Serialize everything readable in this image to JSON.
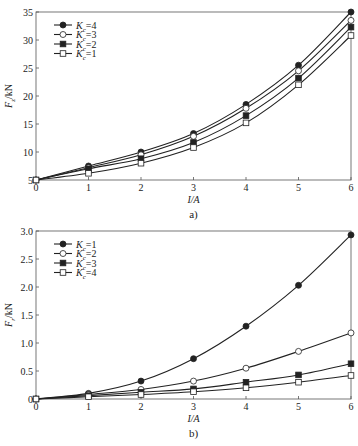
{
  "chart_data": [
    {
      "type": "line",
      "caption": "a)",
      "title": "",
      "xlabel": "I/A",
      "ylabel": "Fz/kN",
      "x": [
        0,
        1,
        2,
        3,
        4,
        5,
        6
      ],
      "xlim": [
        0,
        6
      ],
      "ylim": [
        5,
        35
      ],
      "xticks": [
        0,
        1,
        2,
        3,
        4,
        5,
        6
      ],
      "yticks": [
        5,
        10,
        15,
        20,
        25,
        30,
        35
      ],
      "grid": false,
      "legend_position": "upper left",
      "series": [
        {
          "name": "Kc=4",
          "marker": "filled-circle",
          "values": [
            5,
            7.5,
            10,
            13.3,
            18.5,
            25.5,
            35
          ]
        },
        {
          "name": "Kc=3",
          "marker": "open-circle",
          "values": [
            5,
            7.2,
            9.5,
            12.8,
            17.8,
            24.5,
            33.5
          ]
        },
        {
          "name": "Kc=2",
          "marker": "filled-square",
          "values": [
            5,
            7.0,
            8.8,
            11.7,
            16.5,
            23.2,
            32.3
          ]
        },
        {
          "name": "Kc=1",
          "marker": "open-square",
          "values": [
            5,
            6.2,
            8.0,
            10.8,
            15.2,
            22.0,
            30.8
          ]
        }
      ]
    },
    {
      "type": "line",
      "caption": "b)",
      "title": "",
      "xlabel": "I/A",
      "ylabel": "Fr/kN",
      "x": [
        0,
        1,
        2,
        3,
        4,
        5,
        6
      ],
      "xlim": [
        0,
        6
      ],
      "ylim": [
        0,
        3.0
      ],
      "xticks": [
        0,
        1,
        2,
        3,
        4,
        5,
        6
      ],
      "yticks": [
        0,
        0.5,
        1.0,
        1.5,
        2.0,
        2.5,
        3.0
      ],
      "grid": false,
      "legend_position": "upper left",
      "series": [
        {
          "name": "Kc=1",
          "marker": "filled-circle",
          "values": [
            0,
            0.1,
            0.32,
            0.72,
            1.3,
            2.03,
            2.93
          ]
        },
        {
          "name": "Kc=2",
          "marker": "open-circle",
          "values": [
            0,
            0.08,
            0.17,
            0.32,
            0.55,
            0.85,
            1.18
          ]
        },
        {
          "name": "Kc=3",
          "marker": "filled-square",
          "values": [
            0,
            0.06,
            0.12,
            0.18,
            0.3,
            0.43,
            0.63
          ]
        },
        {
          "name": "Kc=4",
          "marker": "open-square",
          "values": [
            0,
            0.04,
            0.08,
            0.13,
            0.2,
            0.3,
            0.42
          ]
        }
      ]
    }
  ],
  "charts": {
    "a": {
      "caption": "a)",
      "xlabel": "I/A",
      "ylabel_main": "F",
      "ylabel_sub": "z",
      "ylabel_unit": "/kN",
      "yticklabels": [
        "5",
        "10",
        "15",
        "20",
        "25",
        "30",
        "35"
      ],
      "xticklabels": [
        "0",
        "1",
        "2",
        "3",
        "4",
        "5",
        "6"
      ],
      "legend": [
        {
          "main": "K",
          "sub": "c",
          "rest": "=4"
        },
        {
          "main": "K",
          "sub": "c",
          "rest": "=3"
        },
        {
          "main": "K",
          "sub": "c",
          "rest": "=2"
        },
        {
          "main": "K",
          "sub": "c",
          "rest": "=1"
        }
      ]
    },
    "b": {
      "caption": "b)",
      "xlabel": "I/A",
      "ylabel_main": "F",
      "ylabel_sub": "r",
      "ylabel_unit": "/kN",
      "yticklabels": [
        "0",
        "0.5",
        "1.0",
        "1.5",
        "2.0",
        "2.5",
        "3.0"
      ],
      "xticklabels": [
        "0",
        "1",
        "2",
        "3",
        "4",
        "5",
        "6"
      ],
      "legend": [
        {
          "main": "K",
          "sub": "c",
          "rest": "=1"
        },
        {
          "main": "K",
          "sub": "c",
          "rest": "=2"
        },
        {
          "main": "K",
          "sub": "c",
          "rest": "=3"
        },
        {
          "main": "K",
          "sub": "c",
          "rest": "=4"
        }
      ]
    }
  },
  "colors": {
    "line": "#222222",
    "axis": "#555555",
    "background": "#ffffff"
  }
}
